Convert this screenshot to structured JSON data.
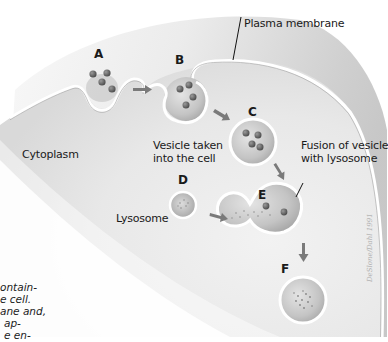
{
  "diagram": {
    "stage_labels": [
      "A",
      "B",
      "C",
      "D",
      "E",
      "F"
    ],
    "labels": {
      "plasma_membrane": "Plasma membrane",
      "cytoplasm": "Cytoplasm",
      "vesicle_taken_line1": "Vesicle taken",
      "vesicle_taken_line2": "into the cell",
      "fusion_line1": "Fusion of vesicle",
      "fusion_line2": "with lysosome",
      "lysosome": "Lysosome"
    },
    "caption_fragment": [
      "ontain-",
      "e cell.",
      "ane and,",
      "ap-",
      "e en-"
    ],
    "signature": "DeSlone/Dahl 1991",
    "colors": {
      "cell_fill": "#e6e6e6",
      "extracellular_fill": "#b8b8b8",
      "membrane": "#ffffff",
      "vesicle_fill": "#c9c9c9",
      "particle": "#6d6d6d",
      "arrow": "#7a7a7a",
      "text": "#1a1a1a"
    }
  }
}
